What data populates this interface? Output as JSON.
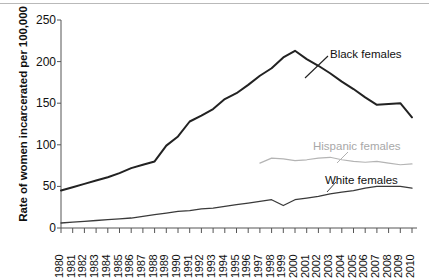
{
  "chart_data": {
    "type": "line",
    "title": "",
    "xlabel": "",
    "ylabel": "Rate of women incarcerated per 100,000",
    "ylim": [
      0,
      250
    ],
    "yticks": [
      0,
      50,
      100,
      150,
      200,
      250
    ],
    "grid": false,
    "legend_position": "inline-annotations",
    "x": [
      1980,
      1981,
      1982,
      1983,
      1984,
      1985,
      1986,
      1987,
      1988,
      1989,
      1990,
      1991,
      1992,
      1993,
      1994,
      1995,
      1996,
      1997,
      1998,
      1999,
      2000,
      2001,
      2002,
      2003,
      2004,
      2005,
      2006,
      2007,
      2008,
      2009,
      2010
    ],
    "xticklabels": [
      "1980",
      "1981",
      "1982",
      "1983",
      "1984",
      "1985",
      "1986",
      "1987",
      "1988",
      "1989",
      "1990",
      "1991",
      "1992",
      "1993",
      "1994",
      "1995",
      "1996",
      "1997",
      "1998",
      "1999",
      "2000",
      "2001",
      "2002",
      "2003",
      "2004",
      "2005",
      "2006",
      "2007",
      "2008",
      "2009",
      "2010"
    ],
    "series": [
      {
        "name": "Black females",
        "color": "#222222",
        "values": [
          45,
          49,
          53,
          57,
          61,
          66,
          72,
          76,
          80,
          99,
          110,
          128,
          135,
          143,
          155,
          162,
          172,
          183,
          192,
          205,
          213,
          203,
          195,
          186,
          176,
          167,
          157,
          148,
          149,
          150,
          133
        ]
      },
      {
        "name": "Hispanic females",
        "color": "#b4b4b4",
        "start_year": 1997,
        "values": [
          null,
          null,
          null,
          null,
          null,
          null,
          null,
          null,
          null,
          null,
          null,
          null,
          null,
          null,
          null,
          null,
          null,
          78,
          84,
          83,
          81,
          82,
          84,
          85,
          82,
          80,
          79,
          80,
          78,
          76,
          77
        ]
      },
      {
        "name": "White females",
        "color": "#3a3a3a",
        "values": [
          6,
          7,
          8,
          9,
          10,
          11,
          12,
          14,
          16,
          18,
          20,
          21,
          23,
          24,
          26,
          28,
          30,
          32,
          34,
          27,
          34,
          36,
          38,
          41,
          43,
          45,
          48,
          50,
          50,
          50,
          48
        ]
      }
    ],
    "annotations": [
      {
        "text": "Black females",
        "series": "Black females"
      },
      {
        "text": "Hispanic females",
        "series": "Hispanic females"
      },
      {
        "text": "White females",
        "series": "White females"
      }
    ]
  }
}
